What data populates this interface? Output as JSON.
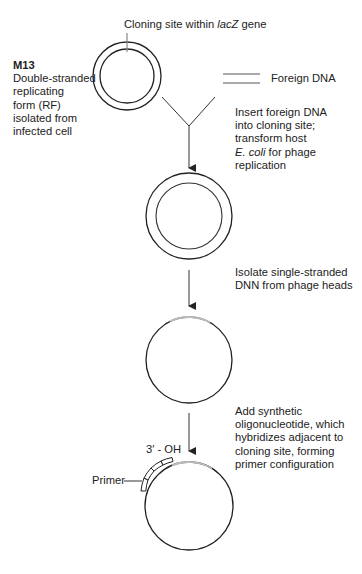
{
  "diagram": {
    "labels": {
      "cloning_site_prefix": "Cloning site within ",
      "cloning_site_gene": "lacZ",
      "cloning_site_suffix": " gene",
      "m13_title": "M13",
      "m13_desc": [
        "Double-stranded",
        "replicating",
        "form (RF)",
        "isolated from",
        "infected cell"
      ],
      "foreign_dna": "Foreign DNA",
      "step1": {
        "lines": [
          "Insert foreign DNA",
          "into cloning site;",
          "transform host"
        ],
        "italic_part": "E. coli",
        "line4_rest": " for phage",
        "line5": "replication"
      },
      "step2": [
        "Isolate single-stranded",
        "DNN from phage heads"
      ],
      "step3": [
        "Add synthetic",
        "oligonucleotide, which",
        "hybridizes adjacent to",
        "cloning site, forming",
        "primer configuration"
      ],
      "three_prime": "3′ - OH",
      "primer": "Primer"
    },
    "nodes": [
      {
        "id": "rf-circle",
        "type": "double-circle",
        "cx": 127,
        "cy": 76,
        "r_outer": 34,
        "r_inner": 27
      },
      {
        "id": "recombinant-circle",
        "type": "double-circle",
        "cx": 189,
        "cy": 216,
        "r_outer": 43,
        "r_inner": 33
      },
      {
        "id": "ss-circle",
        "type": "single-circle",
        "cx": 189,
        "cy": 360,
        "r": 43
      },
      {
        "id": "primed-circle",
        "type": "single-circle-with-primer",
        "cx": 189,
        "cy": 506,
        "r": 44
      }
    ],
    "colors": {
      "stroke": "#222222",
      "gap": "#bbbbbb"
    }
  }
}
